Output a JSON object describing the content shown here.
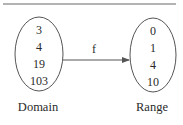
{
  "diagram": {
    "function_label": "f",
    "domain": {
      "label": "Domain",
      "values": [
        "3",
        "4",
        "19",
        "103"
      ]
    },
    "range": {
      "label": "Range",
      "values": [
        "0",
        "1",
        "4",
        "10"
      ]
    },
    "colors": {
      "stroke": "#555555",
      "text": "#2a2a2a",
      "rule": "#9a9a9a"
    }
  }
}
